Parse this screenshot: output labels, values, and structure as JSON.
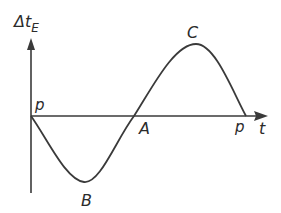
{
  "diagram": {
    "y_axis_label": "Δt",
    "y_axis_subscript": "E",
    "x_axis_label": "t",
    "points": [
      {
        "id": "origin",
        "label": "p"
      },
      {
        "id": "trough",
        "label": "B"
      },
      {
        "id": "crossing",
        "label": "A"
      },
      {
        "id": "peak",
        "label": "C"
      },
      {
        "id": "end",
        "label": "p"
      }
    ],
    "curve": "one full period of a sine-like wave starting at p, dipping to minimum B, crossing axis at A, rising to maximum C, returning to axis at p",
    "colors": {
      "stroke": "#3a3a3a",
      "text": "#2b2b2b",
      "background": "#ffffff"
    }
  }
}
